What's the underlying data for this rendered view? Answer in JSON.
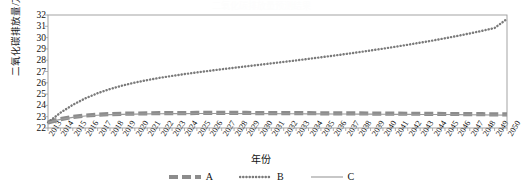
{
  "figure": {
    "faint_title": "二氧化碳排放量预测结果",
    "xlabel": "年份",
    "ylabel": "二氧化碳排放量/万t"
  },
  "legend": {
    "position": "bottom",
    "items": [
      {
        "label": "A",
        "style": "thick-dashed",
        "color": "#8c8c8c"
      },
      {
        "label": "B",
        "style": "dotted",
        "color": "#7a7a7a"
      },
      {
        "label": "C",
        "style": "solid",
        "color": "#9a9a9a"
      }
    ]
  },
  "chart_data": {
    "type": "line",
    "title": "二氧化碳排放量预测结果",
    "xlabel": "年份",
    "ylabel": "二氧化碳排放量/万t",
    "grid": false,
    "legend_position": "bottom",
    "xlim": [
      2013,
      2050
    ],
    "ylim": [
      22,
      32
    ],
    "ytick_values": [
      22,
      23,
      24,
      25,
      26,
      27,
      28,
      29,
      30,
      31,
      32
    ],
    "x": [
      2013,
      2014,
      2015,
      2016,
      2017,
      2018,
      2019,
      2020,
      2021,
      2022,
      2023,
      2024,
      2025,
      2026,
      2027,
      2028,
      2029,
      2030,
      2031,
      2032,
      2033,
      2034,
      2035,
      2036,
      2037,
      2038,
      2039,
      2040,
      2041,
      2042,
      2043,
      2044,
      2045,
      2046,
      2047,
      2048,
      2049,
      2050
    ],
    "categories": [
      "2013",
      "2014",
      "2015",
      "2016",
      "2017",
      "2018",
      "2019",
      "2020",
      "2021",
      "2022",
      "2023",
      "2024",
      "2025",
      "2026",
      "2027",
      "2028",
      "2029",
      "2030",
      "2031",
      "2032",
      "2033",
      "2034",
      "2035",
      "2036",
      "2037",
      "2038",
      "2039",
      "2040",
      "2041",
      "2042",
      "2043",
      "2044",
      "2045",
      "2046",
      "2047",
      "2048",
      "2049",
      "2050"
    ],
    "series": [
      {
        "name": "A",
        "style": "thick-dashed",
        "color": "#8c8c8c",
        "values": [
          22.5,
          22.78,
          22.98,
          23.1,
          23.18,
          23.23,
          23.26,
          23.28,
          23.3,
          23.31,
          23.32,
          23.32,
          23.33,
          23.33,
          23.33,
          23.33,
          23.33,
          23.32,
          23.32,
          23.32,
          23.31,
          23.31,
          23.3,
          23.3,
          23.29,
          23.29,
          23.28,
          23.28,
          23.27,
          23.26,
          23.26,
          23.25,
          23.24,
          23.24,
          23.23,
          23.22,
          23.21,
          23.2
        ]
      },
      {
        "name": "B",
        "style": "dotted",
        "color": "#7a7a7a",
        "values": [
          22.5,
          23.35,
          24.05,
          24.62,
          25.08,
          25.45,
          25.76,
          26.02,
          26.24,
          26.44,
          26.61,
          26.77,
          26.92,
          27.06,
          27.2,
          27.33,
          27.46,
          27.59,
          27.72,
          27.85,
          27.98,
          28.12,
          28.26,
          28.4,
          28.55,
          28.7,
          28.86,
          29.02,
          29.19,
          29.37,
          29.55,
          29.74,
          29.94,
          30.15,
          30.37,
          30.6,
          30.85,
          31.65
        ]
      },
      {
        "name": "C",
        "style": "solid",
        "color": "#9a9a9a",
        "values": [
          22.5,
          22.76,
          22.94,
          23.06,
          23.13,
          23.18,
          23.21,
          23.23,
          23.25,
          23.26,
          23.27,
          23.27,
          23.28,
          23.28,
          23.28,
          23.28,
          23.27,
          23.27,
          23.27,
          23.26,
          23.26,
          23.25,
          23.25,
          23.24,
          23.24,
          23.23,
          23.23,
          23.22,
          23.21,
          23.21,
          23.2,
          23.19,
          23.19,
          23.18,
          23.17,
          23.16,
          23.15,
          23.14
        ]
      }
    ]
  }
}
